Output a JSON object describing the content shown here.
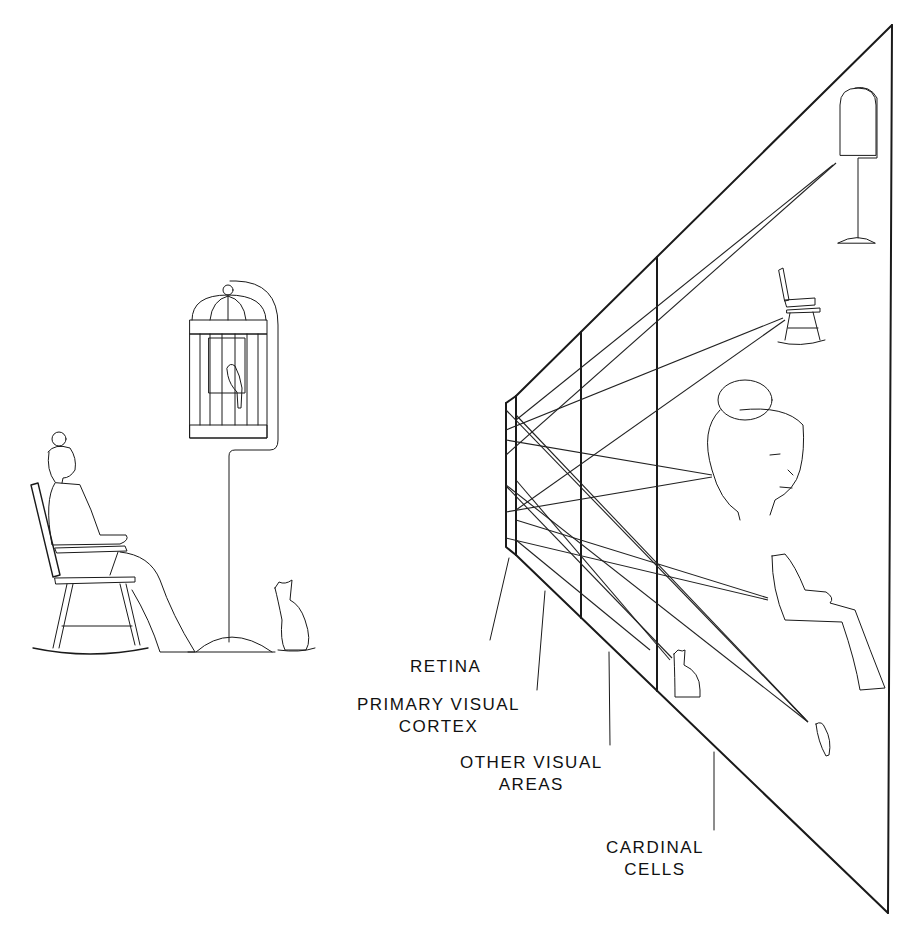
{
  "diagram": {
    "title": "",
    "labels": {
      "retina": "RETINA",
      "primary_visual_cortex": [
        "PRIMARY VISUAL",
        "CORTEX"
      ],
      "other_visual_areas": [
        "OTHER VISUAL",
        "AREAS"
      ],
      "cardinal_cells": [
        "CARDINAL",
        "CELLS"
      ]
    },
    "scene": {
      "description": "Elderly woman in rocking chair, birdcage with bird on stand, cat looking up",
      "objects": [
        "woman",
        "rocking-chair",
        "birdcage",
        "bird",
        "cat"
      ]
    },
    "cardinal_cell_icons": [
      "birdcage",
      "rocking-chair",
      "grandmother-face",
      "seated-body",
      "cat",
      "bird"
    ],
    "stages": [
      "retina",
      "primary visual cortex",
      "other visual areas",
      "cardinal cells"
    ],
    "colors": {
      "ink": "#1a1a1a",
      "background": "#ffffff"
    }
  }
}
